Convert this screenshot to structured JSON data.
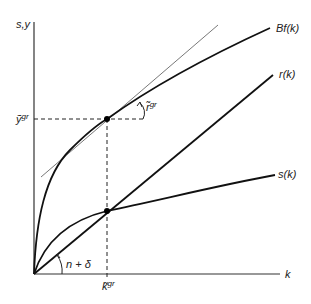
{
  "figure": {
    "type": "diagram",
    "axes": {
      "y_label": "s,y",
      "x_label": "k"
    },
    "curves": {
      "output": "Bf(k)",
      "depreciation": "r(k)",
      "saving": "s(k)"
    },
    "annotations": {
      "y_golden": "ỹ",
      "y_golden_sup": "gr",
      "k_golden": "k̃",
      "k_golden_sup": "gr",
      "tangent_slope": "r̃",
      "tangent_slope_sup": "gr",
      "ray_slope": "n + δ"
    },
    "colors": {
      "line": "#111111",
      "tangent": "#555555",
      "axis": "#333333",
      "background": "#ffffff"
    }
  }
}
